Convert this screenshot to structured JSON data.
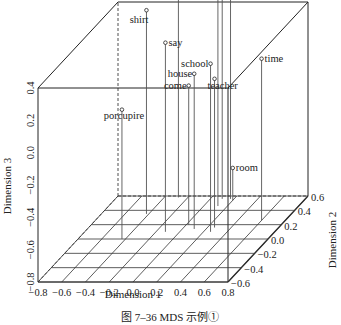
{
  "chart_data": {
    "type": "scatter3d",
    "title": "",
    "caption": "图 7–36   MDS 示例①",
    "xlabel": "Dimension 1",
    "ylabel": "Dimension 2",
    "zlabel": "Dimension 3",
    "xlim": [
      -0.8,
      0.8
    ],
    "ylim": [
      -0.6,
      0.6
    ],
    "zlim": [
      -0.8,
      0.4
    ],
    "xticks": [
      "−0.8",
      "−0.6",
      "−0.4",
      "−0.2",
      "0.0",
      "0.2",
      "0.4",
      "0.6",
      "0.8"
    ],
    "yticks": [
      "−0.6",
      "−0.4",
      "−0.2",
      "0.0",
      "0.2",
      "0.4",
      "0.6"
    ],
    "zticks": [
      "−0.8",
      "−0.6",
      "−0.4",
      "−0.2",
      "0.0",
      "0.2",
      "0.4"
    ],
    "xtick_values": [
      -0.8,
      -0.6,
      -0.4,
      -0.2,
      0.0,
      0.2,
      0.4,
      0.6,
      0.8
    ],
    "ytick_values": [
      -0.6,
      -0.4,
      -0.2,
      0.0,
      0.2,
      0.4,
      0.6
    ],
    "ztick_values": [
      -0.8,
      -0.6,
      -0.4,
      -0.2,
      0.0,
      0.2,
      0.4
    ],
    "grid": "floor",
    "points": [
      {
        "label": "Red",
        "x": -0.28,
        "y": 0.58,
        "z": 0.72,
        "label_side": "right"
      },
      {
        "label": "shirt",
        "x": -0.42,
        "y": 0.35,
        "z": 0.46,
        "label_side": "left-below"
      },
      {
        "label": "porcupire",
        "x": -0.43,
        "y": 0.0,
        "z": 0.0,
        "label_side": "below"
      },
      {
        "label": "say",
        "x": -0.12,
        "y": 0.1,
        "z": 0.37,
        "label_side": "right"
      },
      {
        "label": "come",
        "x": 0.02,
        "y": 0.2,
        "z": 0.06,
        "label_side": "left"
      },
      {
        "label": "tell",
        "x": 0.12,
        "y": 0.46,
        "z": 0.6,
        "label_side": "left"
      },
      {
        "label": "house",
        "x": 0.1,
        "y": 0.14,
        "z": 0.16,
        "label_side": "left"
      },
      {
        "label": "school",
        "x": 0.26,
        "y": 0.1,
        "z": 0.24,
        "label_side": "left"
      },
      {
        "label": "teacher",
        "x": 0.26,
        "y": 0.16,
        "z": 0.12,
        "label_side": "right-below"
      },
      {
        "label": "think",
        "x": 0.1,
        "y": 0.56,
        "z": 1.16,
        "label_side": "right"
      },
      {
        "label": "make",
        "x": 0.17,
        "y": 0.56,
        "z": 0.95,
        "label_side": "right"
      },
      {
        "label": "time",
        "x": 0.6,
        "y": 0.26,
        "z": 0.2,
        "label_side": "right"
      },
      {
        "label": "room",
        "x": 0.2,
        "y": 0.54,
        "z": -0.6,
        "label_side": "right"
      }
    ]
  },
  "colors": {
    "axis": "#222222",
    "grid": "#333333",
    "drop_line": "#555555"
  }
}
